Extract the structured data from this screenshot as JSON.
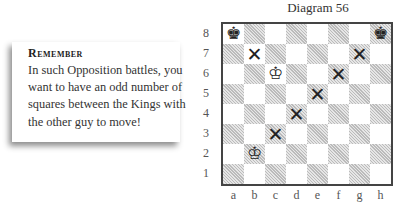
{
  "note": {
    "title": "Remember",
    "body": "In such Opposition battles, you want to have an odd number of squares between the Kings with the other guy to move!"
  },
  "diagram": {
    "title": "Diagram 56",
    "ranks": [
      "8",
      "7",
      "6",
      "5",
      "4",
      "3",
      "2",
      "1"
    ],
    "files": [
      "a",
      "b",
      "c",
      "d",
      "e",
      "f",
      "g",
      "h"
    ],
    "pieces": [
      {
        "square": "a8",
        "glyph": "♚",
        "name": "black-king"
      },
      {
        "square": "h8",
        "glyph": "♚",
        "name": "black-king"
      },
      {
        "square": "c6",
        "glyph": "♔",
        "name": "white-king"
      },
      {
        "square": "b2",
        "glyph": "♔",
        "name": "white-king"
      }
    ],
    "marks": [
      {
        "square": "b7",
        "glyph": "✕"
      },
      {
        "square": "g7",
        "glyph": "✕"
      },
      {
        "square": "f6",
        "glyph": "✕"
      },
      {
        "square": "e5",
        "glyph": "✕"
      },
      {
        "square": "d4",
        "glyph": "✕"
      },
      {
        "square": "c3",
        "glyph": "✕"
      }
    ]
  }
}
